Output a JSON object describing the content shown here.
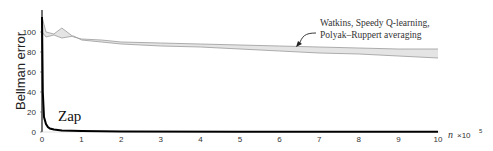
{
  "chart_data": {
    "type": "line",
    "title": "",
    "xlabel": "n ×10^5",
    "ylabel": "Bellman error",
    "xlim": [
      0,
      10
    ],
    "ylim": [
      0,
      115
    ],
    "x_ticks": [
      "0",
      "1",
      "2",
      "3",
      "4",
      "5",
      "6",
      "7",
      "8",
      "9",
      "10"
    ],
    "y_ticks": [
      "0",
      "20",
      "40",
      "60",
      "80",
      "100"
    ],
    "grid": false,
    "series": [
      {
        "name": "Watkins, Speedy Q-learning, Polyak–Ruppert averaging (upper)",
        "x": [
          0,
          0.1,
          0.3,
          0.5,
          0.8,
          1,
          1.5,
          2,
          3,
          4,
          5,
          6,
          7,
          8,
          9,
          10
        ],
        "values": [
          115,
          100,
          98,
          104,
          95,
          93,
          92,
          90,
          89,
          88,
          87,
          86,
          85,
          84,
          83,
          83
        ]
      },
      {
        "name": "Watkins, Speedy Q-learning, Polyak–Ruppert averaging (lower)",
        "x": [
          0,
          0.1,
          0.3,
          0.5,
          0.8,
          1,
          1.5,
          2,
          3,
          4,
          5,
          6,
          7,
          8,
          9,
          10
        ],
        "values": [
          100,
          95,
          97,
          94,
          96,
          92,
          90,
          88,
          86,
          85,
          83,
          81,
          79,
          78,
          76,
          74
        ]
      },
      {
        "name": "Zap",
        "x": [
          0,
          0.02,
          0.05,
          0.1,
          0.15,
          0.2,
          0.3,
          0.5,
          1,
          2,
          5,
          10
        ],
        "values": [
          115,
          40,
          15,
          8,
          5,
          3.5,
          2.5,
          1.5,
          1,
          0.6,
          0.3,
          0.2
        ]
      }
    ],
    "annotations": [
      {
        "text": "Watkins, Speedy Q-learning,",
        "line": 1
      },
      {
        "text": "Polyak–Ruppert averaging",
        "line": 2
      },
      {
        "text": "Zap"
      }
    ]
  },
  "labels": {
    "ylabel": "Bellman error",
    "annot_line1": "Watkins, Speedy Q-learning,",
    "annot_line2": "Polyak–Ruppert averaging",
    "zap": "Zap",
    "x_unit_n": "n",
    "x_unit_mult": "×10",
    "x_unit_exp": "5"
  }
}
